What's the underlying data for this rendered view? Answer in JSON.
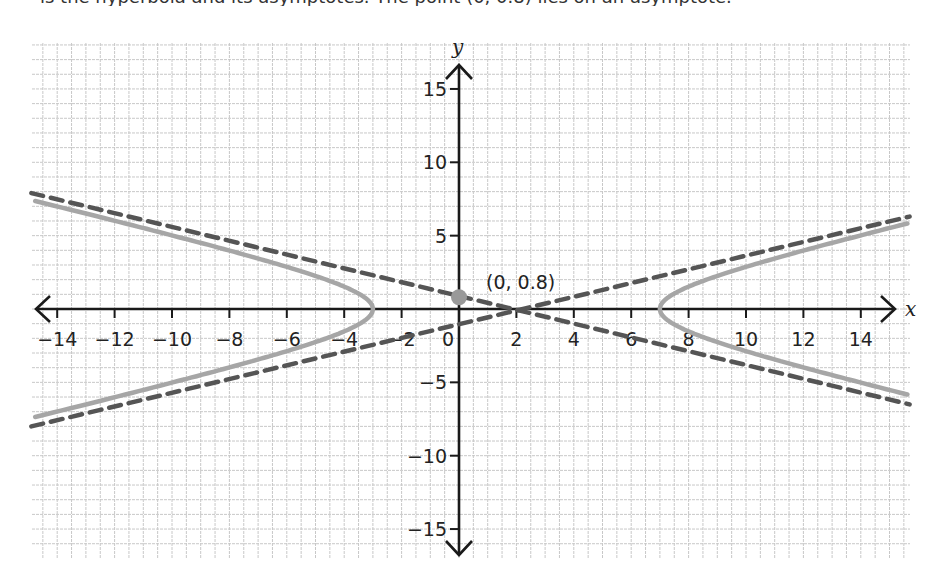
{
  "header": {
    "clipped_text": "is the hyperbola and its asymptotes. The point (0, 0.8) lies on an asymptote."
  },
  "chart_data": {
    "type": "line",
    "title": "",
    "xlabel": "x",
    "ylabel": "y",
    "xlim": [
      -14.9,
      15.8
    ],
    "ylim": [
      -17,
      18
    ],
    "grid": true,
    "x_ticks": [
      -14,
      -12,
      -10,
      -8,
      -6,
      -4,
      -2,
      0,
      2,
      4,
      6,
      8,
      10,
      12,
      14
    ],
    "x_tick_labels": [
      "−14",
      "−12",
      "−10",
      "−8",
      "−6",
      "−4",
      "−2",
      "0",
      "2",
      "4",
      "6",
      "8",
      "10",
      "12",
      "14"
    ],
    "y_ticks": [
      -15,
      -10,
      -5,
      5,
      10,
      15
    ],
    "y_tick_labels": [
      "−15",
      "−10",
      "−5",
      "5",
      "10",
      "15"
    ],
    "series": [
      {
        "name": "hyperbola",
        "style": "solid",
        "color": "#a6a6a6",
        "center": [
          2,
          0
        ],
        "a": 5,
        "b": 2.3,
        "vertices": [
          [
            -3,
            0
          ],
          [
            7,
            0
          ]
        ],
        "sample_points": [
          [
            -14.9,
            7.0
          ],
          [
            -3,
            0
          ],
          [
            -14.9,
            -7.1
          ],
          [
            15.7,
            5.5
          ],
          [
            7,
            0
          ],
          [
            15.7,
            -5.7
          ]
        ]
      },
      {
        "name": "asymptote-1",
        "style": "dashed",
        "color": "#555555",
        "points": [
          [
            -14.9,
            7.9
          ],
          [
            0,
            0.8
          ],
          [
            15.7,
            -6.5
          ]
        ]
      },
      {
        "name": "asymptote-2",
        "style": "dashed",
        "color": "#555555",
        "points": [
          [
            -14.9,
            -8.0
          ],
          [
            0,
            -0.9
          ],
          [
            15.7,
            6.3
          ]
        ]
      }
    ],
    "annotations": [
      {
        "point": [
          0,
          0.8
        ],
        "label": "(0, 0.8)",
        "marker_color": "#999999"
      }
    ]
  }
}
